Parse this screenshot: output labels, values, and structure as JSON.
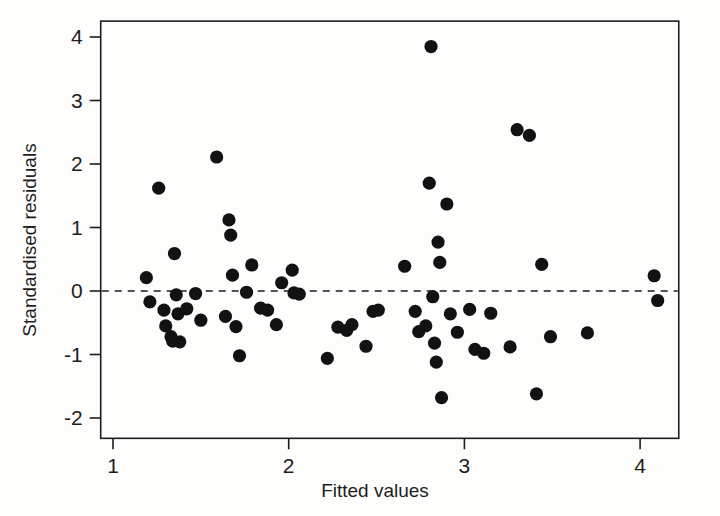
{
  "chart_data": {
    "type": "scatter",
    "title": "",
    "xlabel": "Fitted values",
    "ylabel": "Standardised residuals",
    "xlim": [
      0.93,
      4.22
    ],
    "ylim": [
      -2.32,
      4.25
    ],
    "xticks": [
      1,
      2,
      3,
      4
    ],
    "xtick_labels": [
      "1",
      "2",
      "3",
      "4"
    ],
    "yticks": [
      -2,
      -1,
      0,
      1,
      2,
      3,
      4
    ],
    "ytick_labels": [
      "-2",
      "-1",
      "0",
      "1",
      "2",
      "3",
      "4"
    ],
    "grid": false,
    "legend": null,
    "annotations": [
      {
        "type": "hline",
        "y": 0,
        "style": "dashed",
        "label": "zero residual reference line"
      }
    ],
    "marker": {
      "shape": "circle",
      "color": "#121212",
      "size": 8
    },
    "series": [
      {
        "name": "standardised residuals",
        "points": [
          {
            "x": 1.19,
            "y": 0.21
          },
          {
            "x": 1.21,
            "y": -0.17
          },
          {
            "x": 1.26,
            "y": 1.62
          },
          {
            "x": 1.29,
            "y": -0.3
          },
          {
            "x": 1.3,
            "y": -0.55
          },
          {
            "x": 1.33,
            "y": -0.72
          },
          {
            "x": 1.34,
            "y": -0.79
          },
          {
            "x": 1.35,
            "y": 0.59
          },
          {
            "x": 1.36,
            "y": -0.06
          },
          {
            "x": 1.37,
            "y": -0.36
          },
          {
            "x": 1.38,
            "y": -0.8
          },
          {
            "x": 1.42,
            "y": -0.28
          },
          {
            "x": 1.47,
            "y": -0.04
          },
          {
            "x": 1.5,
            "y": -0.46
          },
          {
            "x": 1.59,
            "y": 2.11
          },
          {
            "x": 1.64,
            "y": -0.4
          },
          {
            "x": 1.66,
            "y": 1.12
          },
          {
            "x": 1.67,
            "y": 0.88
          },
          {
            "x": 1.68,
            "y": 0.25
          },
          {
            "x": 1.7,
            "y": -0.56
          },
          {
            "x": 1.72,
            "y": -1.02
          },
          {
            "x": 1.76,
            "y": -0.02
          },
          {
            "x": 1.79,
            "y": 0.41
          },
          {
            "x": 1.84,
            "y": -0.27
          },
          {
            "x": 1.88,
            "y": -0.3
          },
          {
            "x": 1.93,
            "y": -0.53
          },
          {
            "x": 1.96,
            "y": 0.13
          },
          {
            "x": 2.02,
            "y": 0.33
          },
          {
            "x": 2.03,
            "y": -0.03
          },
          {
            "x": 2.06,
            "y": -0.05
          },
          {
            "x": 2.22,
            "y": -1.06
          },
          {
            "x": 2.28,
            "y": -0.57
          },
          {
            "x": 2.33,
            "y": -0.62
          },
          {
            "x": 2.36,
            "y": -0.53
          },
          {
            "x": 2.44,
            "y": -0.87
          },
          {
            "x": 2.48,
            "y": -0.32
          },
          {
            "x": 2.51,
            "y": -0.3
          },
          {
            "x": 2.66,
            "y": 0.39
          },
          {
            "x": 2.72,
            "y": -0.32
          },
          {
            "x": 2.74,
            "y": -0.64
          },
          {
            "x": 2.78,
            "y": -0.55
          },
          {
            "x": 2.8,
            "y": 1.7
          },
          {
            "x": 2.81,
            "y": 3.85
          },
          {
            "x": 2.82,
            "y": -0.09
          },
          {
            "x": 2.83,
            "y": -0.82
          },
          {
            "x": 2.84,
            "y": -1.12
          },
          {
            "x": 2.85,
            "y": 0.77
          },
          {
            "x": 2.86,
            "y": 0.45
          },
          {
            "x": 2.87,
            "y": -1.68
          },
          {
            "x": 2.9,
            "y": 1.37
          },
          {
            "x": 2.92,
            "y": -0.36
          },
          {
            "x": 2.96,
            "y": -0.65
          },
          {
            "x": 3.03,
            "y": -0.29
          },
          {
            "x": 3.06,
            "y": -0.92
          },
          {
            "x": 3.11,
            "y": -0.98
          },
          {
            "x": 3.15,
            "y": -0.35
          },
          {
            "x": 3.26,
            "y": -0.88
          },
          {
            "x": 3.3,
            "y": 2.54
          },
          {
            "x": 3.37,
            "y": 2.45
          },
          {
            "x": 3.41,
            "y": -1.62
          },
          {
            "x": 3.44,
            "y": 0.42
          },
          {
            "x": 3.49,
            "y": -0.72
          },
          {
            "x": 3.7,
            "y": -0.66
          },
          {
            "x": 4.08,
            "y": 0.24
          },
          {
            "x": 4.1,
            "y": -0.15
          }
        ]
      }
    ]
  },
  "axes": {
    "x_title": "Fitted values",
    "y_title": "Standardised residuals"
  }
}
